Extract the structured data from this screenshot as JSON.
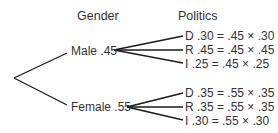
{
  "headers": {
    "level1": "Gender",
    "level2": "Politics"
  },
  "tree": {
    "gender": [
      {
        "label": "Male .45",
        "branches": [
          {
            "label": "D .30 = .45 × .30"
          },
          {
            "label": "R .45 = .45 × .45"
          },
          {
            "label": "I  .25 = .45 × .25"
          }
        ]
      },
      {
        "label": "Female .55",
        "branches": [
          {
            "label": "D .35 = .55 × .35"
          },
          {
            "label": "R .35 = .55 × .35"
          },
          {
            "label": "I  .30 = .55 × .30"
          }
        ]
      }
    ]
  },
  "colors": {
    "line": "#1a1a1a",
    "text": "#333333",
    "background": "#ffffff"
  }
}
